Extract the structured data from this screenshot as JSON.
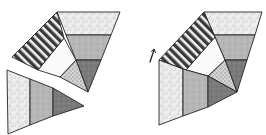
{
  "diagram": {
    "fills": {
      "light_speckle": "#eeeeee",
      "mid_gray": "#b8b8b8",
      "dark_gray": "#7a7a7a",
      "white": "#fafafa",
      "dotted": "#c8c8c8",
      "stripe_dark": "#3a3a3a",
      "stripe_light": "#f2f2f2",
      "outline": "#222222"
    },
    "figures": [
      {
        "name": "left-figure",
        "pieces": [
          {
            "name": "top-band",
            "fill": "light_speckle",
            "points": "57,12 120,12 111,35 66,35"
          },
          {
            "name": "middle-band",
            "fill": "mid_gray",
            "points": "66,35 111,35 101,60 76,60"
          },
          {
            "name": "lower-dark-triangle",
            "fill": "dark_gray",
            "points": "76,60 101,60 88,92"
          },
          {
            "name": "dotted-triangle",
            "fill": "dotted",
            "points": "76,60 88,92 60,77"
          },
          {
            "name": "white-quad",
            "fill": "white",
            "points": "64,38 76,60 60,77 38,70"
          },
          {
            "name": "striped-band",
            "fill": "stripes",
            "points": "57,12 64,38 38,70 12,57"
          },
          {
            "name": "detached-triangle-section-1",
            "fill": "light_speckle",
            "points": "7,70 30,79 30,125 8,134"
          },
          {
            "name": "detached-triangle-section-2",
            "fill": "mid_gray",
            "points": "30,79 53,88 53,116 30,125"
          },
          {
            "name": "detached-triangle-section-3",
            "fill": "dark_gray",
            "points": "53,88 84,106 53,116"
          }
        ]
      },
      {
        "name": "right-figure",
        "pieces": [
          {
            "name": "top-band",
            "fill": "light_speckle",
            "points": "204,12 262,12 255,35 214,35"
          },
          {
            "name": "middle-band",
            "fill": "mid_gray",
            "points": "214,35 255,35 247,60 225,60"
          },
          {
            "name": "lower-dark-triangle",
            "fill": "dark_gray",
            "points": "225,60 247,60 237,92"
          },
          {
            "name": "dotted-triangle",
            "fill": "dotted",
            "points": "225,60 237,92 208,76"
          },
          {
            "name": "white-quad",
            "fill": "white",
            "points": "215,37 225,60 208,76 186,70"
          },
          {
            "name": "striped-band",
            "fill": "stripes",
            "points": "204,12 215,37 186,70 159,60"
          },
          {
            "name": "rotated-triangle-section-1",
            "fill": "light_speckle",
            "points": "159,60 183,69 183,116 159,125"
          },
          {
            "name": "rotated-triangle-section-2",
            "fill": "mid_gray",
            "points": "183,69 208,76 208,107 183,116"
          },
          {
            "name": "rotated-triangle-section-3",
            "fill": "dark_gray",
            "points": "208,76 237,92 208,107"
          }
        ],
        "rotation_arrow": {
          "points": "154,50 150,62"
        }
      }
    ]
  }
}
